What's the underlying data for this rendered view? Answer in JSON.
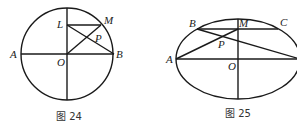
{
  "figures": [
    {
      "caption": "图 24",
      "shape": "circle",
      "points": {
        "A": "A",
        "B": "B",
        "O": "O",
        "L": "L",
        "M": "M",
        "P": "P"
      }
    },
    {
      "caption": "图 25",
      "shape": "ellipse",
      "points": {
        "A": "A",
        "B": "B",
        "C": "C",
        "M": "M",
        "O": "O",
        "P": "P"
      }
    }
  ]
}
